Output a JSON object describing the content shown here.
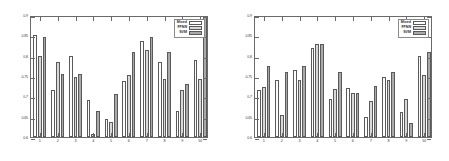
{
  "figure": {
    "panels": [
      "left",
      "right"
    ],
    "colors": {
      "series_mixed": "#fdfdfd",
      "series_ffnn": "#d8d8d8",
      "series_svm": "#a9a9a9",
      "axis": "#6a6a6a",
      "background": "#ffffff"
    }
  },
  "legend": {
    "entries": [
      {
        "label": "Mixed",
        "swatch": "series-swatch-mixed"
      },
      {
        "label": "FFNN",
        "swatch": "series-swatch-ffnn"
      },
      {
        "label": "SVM",
        "swatch": "series-swatch-svm"
      }
    ]
  },
  "chart_data": [
    {
      "type": "bar",
      "title": "",
      "panel": "left",
      "xlabel": "",
      "ylabel": "",
      "ylim": [
        0.6,
        0.9
      ],
      "yticks": [
        0.6,
        0.65,
        0.7,
        0.75,
        0.8,
        0.85,
        0.9
      ],
      "ytick_labels": [
        "0.6",
        "0.65",
        "0.7",
        "0.75",
        "0.8",
        "0.85",
        "0.9"
      ],
      "grid": false,
      "legend_position": "upper right",
      "categories": [
        "1",
        "2",
        "3",
        "4",
        "5",
        "6",
        "7",
        "8",
        "9",
        "10"
      ],
      "series": [
        {
          "name": "Mixed",
          "values": [
            0.85,
            0.715,
            0.8,
            0.69,
            0.645,
            0.737,
            0.835,
            0.785,
            0.665,
            0.79
          ]
        },
        {
          "name": "FFNN",
          "values": [
            0.8,
            0.785,
            0.748,
            0.608,
            0.638,
            0.752,
            0.815,
            0.742,
            0.715,
            0.742
          ]
        },
        {
          "name": "SVM",
          "values": [
            0.845,
            0.755,
            0.755,
            0.665,
            0.705,
            0.81,
            0.845,
            0.81,
            0.73,
            0.9
          ]
        }
      ]
    },
    {
      "type": "bar",
      "title": "",
      "panel": "right",
      "xlabel": "",
      "ylabel": "",
      "ylim": [
        0.6,
        0.9
      ],
      "yticks": [
        0.6,
        0.65,
        0.7,
        0.75,
        0.8,
        0.85,
        0.9
      ],
      "ytick_labels": [
        "0.6",
        "0.65",
        "0.7",
        "0.75",
        "0.8",
        "0.85",
        "0.9"
      ],
      "grid": false,
      "legend_position": "upper right",
      "categories": [
        "1",
        "2",
        "3",
        "4",
        "5",
        "6",
        "7",
        "8",
        "9",
        "10"
      ],
      "series": [
        {
          "name": "Mixed",
          "values": [
            0.715,
            0.74,
            0.765,
            0.818,
            0.693,
            0.72,
            0.65,
            0.748,
            0.662,
            0.798
          ]
        },
        {
          "name": "FFNN",
          "values": [
            0.723,
            0.655,
            0.74,
            0.828,
            0.717,
            0.708,
            0.688,
            0.74,
            0.693,
            0.752
          ]
        },
        {
          "name": "SVM",
          "values": [
            0.775,
            0.76,
            0.775,
            0.828,
            0.76,
            0.708,
            0.725,
            0.76,
            0.635,
            0.81
          ]
        }
      ]
    }
  ]
}
